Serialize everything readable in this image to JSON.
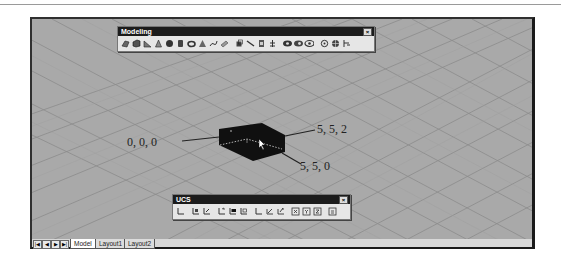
{
  "viewport": {
    "background": "#a9a9a9",
    "grid_color": "#8a8a8a",
    "solid_color": "#111111"
  },
  "modeling_toolbar": {
    "title": "Modeling",
    "close_glyph": "×",
    "buttons": [
      {
        "name": "polysolid-icon"
      },
      {
        "name": "box-icon"
      },
      {
        "name": "wedge-icon"
      },
      {
        "name": "cone-icon"
      },
      {
        "name": "sphere-icon"
      },
      {
        "name": "cylinder-icon"
      },
      {
        "name": "torus-icon"
      },
      {
        "name": "pyramid-icon"
      },
      {
        "name": "helix-icon"
      },
      {
        "name": "planar-surface-icon"
      },
      {
        "name": "extrude-icon"
      },
      {
        "name": "presspull-icon"
      },
      {
        "name": "sweep-icon"
      },
      {
        "name": "revolve-icon"
      },
      {
        "name": "union-icon"
      },
      {
        "name": "subtract-icon"
      },
      {
        "name": "intersect-icon"
      },
      {
        "name": "3d-move-icon"
      },
      {
        "name": "3d-rotate-icon"
      },
      {
        "name": "3d-align-icon"
      }
    ]
  },
  "ucs_toolbar": {
    "title": "UCS",
    "close_glyph": "×",
    "buttons": [
      {
        "name": "ucs-icon"
      },
      {
        "name": "world-ucs-icon"
      },
      {
        "name": "previous-ucs-icon"
      },
      {
        "name": "face-ucs-icon"
      },
      {
        "name": "object-ucs-icon"
      },
      {
        "name": "view-ucs-icon"
      },
      {
        "name": "origin-ucs-icon"
      },
      {
        "name": "z-axis-vector-ucs-icon"
      },
      {
        "name": "3-point-ucs-icon"
      },
      {
        "name": "x-ucs-icon"
      },
      {
        "name": "y-ucs-icon"
      },
      {
        "name": "z-ucs-icon"
      },
      {
        "name": "apply-ucs-icon"
      }
    ]
  },
  "annotations": {
    "origin": "0, 0, 0",
    "top_corner": "5, 5, 2",
    "bottom_corner": "5, 5, 0"
  },
  "tabs": {
    "nav": [
      "|◀",
      "◀",
      "▶",
      "▶|"
    ],
    "items": [
      {
        "label": "Model",
        "active": true
      },
      {
        "label": "Layout1",
        "active": false
      },
      {
        "label": "Layout2",
        "active": false
      }
    ]
  }
}
